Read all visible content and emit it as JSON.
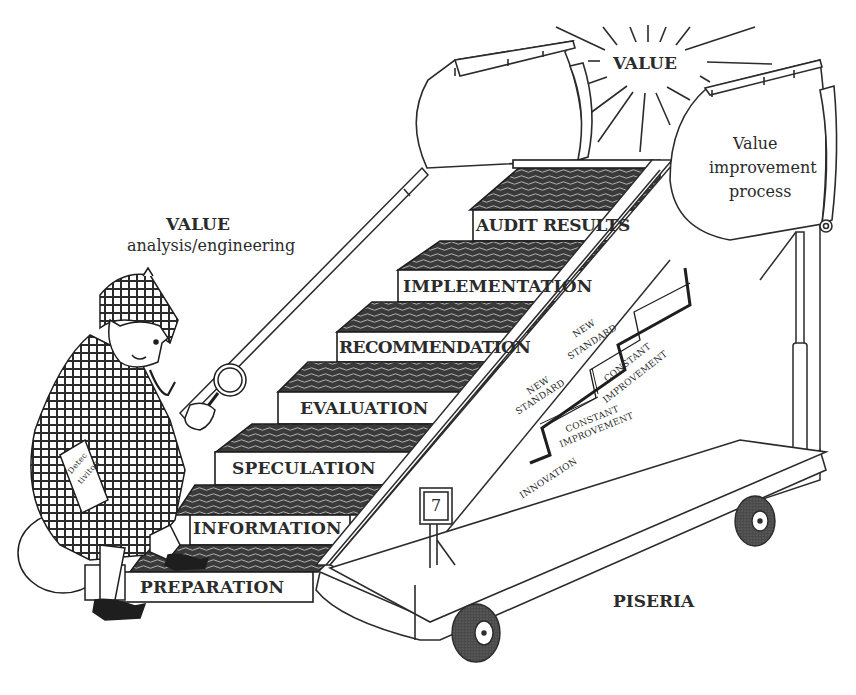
{
  "title_left": {
    "heading": "VALUE",
    "subheading": "analysis/engineering"
  },
  "sun": {
    "label": "VALUE"
  },
  "banner": {
    "line1": "Value",
    "line2": "improvement",
    "line3": "process"
  },
  "steps": [
    {
      "label": "PREPARATION"
    },
    {
      "label": "INFORMATION"
    },
    {
      "label": "SPECULATION"
    },
    {
      "label": "EVALUATION"
    },
    {
      "label": "RECOMMENDATION"
    },
    {
      "label": "IMPLEMENTATION"
    },
    {
      "label": "AUDIT RESULTS"
    }
  ],
  "improvement_ladder": {
    "innovation": "INNOVATION",
    "constant_improvement_1": [
      "CONSTANT",
      "IMPROVEMENT"
    ],
    "new_standard_1": [
      "NEW",
      "STANDARD"
    ],
    "constant_improvement_2": [
      "CONSTANT",
      "IMPROVEMENT"
    ],
    "new_standard_2": [
      "NEW",
      "STANDARD"
    ]
  },
  "book": {
    "line1": "Detec",
    "line2": "tiviton"
  },
  "counter_box": {
    "value": "7"
  },
  "cart_label": "PISERIA"
}
